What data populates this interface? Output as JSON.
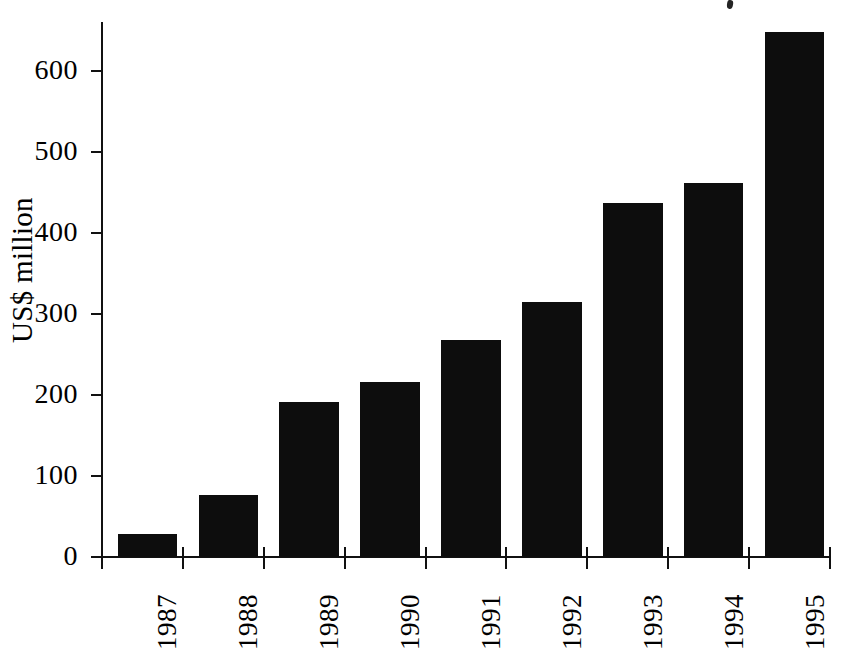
{
  "chart_data": {
    "type": "bar",
    "title": "",
    "subtitle": "",
    "xlabel": "",
    "ylabel": "US$ million",
    "categories": [
      "1987",
      "1988",
      "1989",
      "1990",
      "1991",
      "1992",
      "1993",
      "1994",
      "1995"
    ],
    "values": [
      28,
      76,
      191,
      216,
      268,
      315,
      437,
      461,
      648
    ],
    "series": [
      {
        "name": "US$ million",
        "values": [
          28,
          76,
          191,
          216,
          268,
          315,
          437,
          461,
          648
        ]
      }
    ],
    "ylim": [
      0,
      660
    ],
    "yticks": [
      0,
      100,
      200,
      300,
      400,
      500,
      600
    ],
    "ytick_labels": [
      "0",
      "100",
      "200",
      "300",
      "400",
      "500",
      "600"
    ],
    "grid": false,
    "legend": false,
    "legend_position": "none",
    "bar_color": "#0d0d0d",
    "background_color": "#ffffff",
    "axis_color": "#111111",
    "xtick_label_rotation": "-90",
    "annotations": []
  },
  "axis": {
    "y_title": "US$ million"
  }
}
